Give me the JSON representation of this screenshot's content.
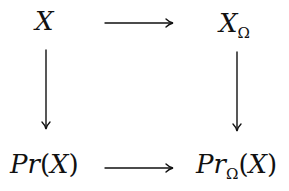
{
  "diagram": {
    "type": "commutative-square",
    "nodes": {
      "top_left": {
        "main": "X"
      },
      "top_right": {
        "main": "X",
        "sub": "Ω"
      },
      "bottom_left": {
        "main": "Pr",
        "open": "(",
        "arg": "X",
        "close": ")"
      },
      "bottom_right": {
        "main": "Pr",
        "sub": "Ω",
        "open": "(",
        "arg": "X",
        "close": ")"
      }
    },
    "edges": [
      {
        "from": "X",
        "to": "XΩ",
        "direction": "right"
      },
      {
        "from": "X",
        "to": "Pr(X)",
        "direction": "down"
      },
      {
        "from": "XΩ",
        "to": "PrΩ(X)",
        "direction": "down"
      },
      {
        "from": "Pr(X)",
        "to": "PrΩ(X)",
        "direction": "right"
      }
    ],
    "stroke_color": "#111111"
  }
}
